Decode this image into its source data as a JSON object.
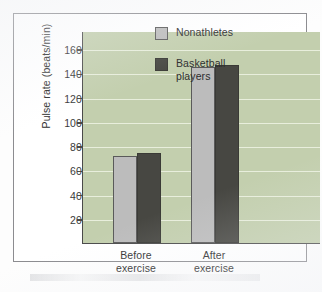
{
  "chart_data": {
    "type": "bar",
    "title": "",
    "subtitle": "",
    "xlabel": "",
    "ylabel": "Pulse rate (beats/min)",
    "categories": [
      "Before\nexercise",
      "After\nexercise"
    ],
    "category_labels": [
      {
        "line1": "Before",
        "line2": "exercise"
      },
      {
        "line1": "After",
        "line2": "exercise"
      }
    ],
    "series": [
      {
        "name": "Nonathletes",
        "values": [
          72,
          145
        ],
        "color": "#bcbcbc"
      },
      {
        "name": "Basketball players",
        "name_line1": "Basketball",
        "name_line2": "players",
        "values": [
          74,
          147
        ],
        "color": "#474742"
      }
    ],
    "ylim": [
      0,
      175
    ],
    "yticks": [
      20,
      40,
      60,
      80,
      100,
      120,
      140,
      160
    ],
    "ytick_labels": [
      "20",
      "40",
      "60",
      "80",
      "100",
      "120",
      "140",
      "160"
    ],
    "grid": true,
    "grid_orientation": "horizontal",
    "legend_position": "top-right",
    "plot_background": "#c3cfae",
    "gridline_color": "#eef3e4",
    "axis_color": "#4a4a4a"
  },
  "axis": {
    "y_title": "Pulse rate (beats/min)"
  },
  "legend": {
    "entries": [
      {
        "label": "Nonathletes",
        "line1": "Nonathletes",
        "line2": ""
      },
      {
        "label": "Basketball players",
        "line1": "Basketball",
        "line2": "players"
      }
    ]
  }
}
